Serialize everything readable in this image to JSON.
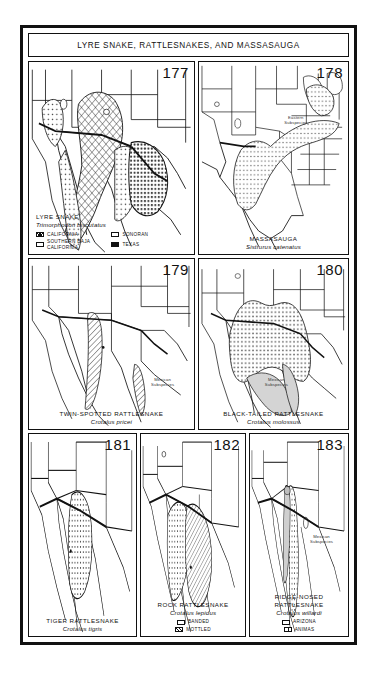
{
  "plate": {
    "title": "LYRE SNAKE, RATTLESNAKES, AND MASSASAUGA"
  },
  "panels": [
    {
      "number": "177",
      "common_name": "LYRE SNAKE",
      "scientific_name": "Trimorphodon biscutatus",
      "caption_align": "left",
      "legend": [
        {
          "label": "CALIFORNIA",
          "pattern": "grid"
        },
        {
          "label": "SONORAN",
          "pattern": "dot"
        },
        {
          "label": "SOUTHERN BAJA CALIFORNIA",
          "pattern": "dot2"
        },
        {
          "label": "TEXAS",
          "pattern": "dark"
        }
      ],
      "annotations": []
    },
    {
      "number": "178",
      "common_name": "MASSASAUGA",
      "scientific_name": "Sistrurus catenatus",
      "caption_align": "center",
      "legend": [],
      "annotations": [
        {
          "text": "Eastern\nSubspecies",
          "x": 60,
          "y": 30
        }
      ]
    },
    {
      "number": "179",
      "common_name": "TWIN-SPOTTED RATTLESNAKE",
      "scientific_name": "Crotalus pricei",
      "caption_align": "center",
      "legend": [],
      "annotations": [
        {
          "text": "Mexican\nSubspecies",
          "x": 69,
          "y": 73
        }
      ]
    },
    {
      "number": "180",
      "common_name": "BLACK-TAILED RATTLESNAKE",
      "scientific_name": "Crotalus molossus",
      "caption_align": "center",
      "legend": [],
      "annotations": [
        {
          "text": "Mexican\nSubspecies",
          "x": 40,
          "y": 74
        }
      ]
    },
    {
      "number": "181",
      "common_name": "TIGER RATTLESNAKE",
      "scientific_name": "Crotalus tigris",
      "caption_align": "center",
      "legend": [],
      "annotations": []
    },
    {
      "number": "182",
      "common_name": "ROCK RATTLESNAKE",
      "scientific_name": "Crotalus lepidus",
      "caption_align": "center",
      "legend": [
        {
          "label": "BANDED",
          "pattern": "dot"
        },
        {
          "label": "MOTTLED",
          "pattern": "hatch"
        }
      ],
      "annotations": []
    },
    {
      "number": "183",
      "common_name": "RIDGE-NOSED RATTLESNAKE",
      "scientific_name": "Crotalus willardi",
      "caption_align": "center",
      "legend": [
        {
          "label": "ARIZONA",
          "pattern": "dot"
        },
        {
          "label": "ANIMAS",
          "pattern": "cross"
        }
      ],
      "annotations": [
        {
          "text": "Mexican\nSubspecies",
          "x": 63,
          "y": 55
        }
      ]
    }
  ],
  "colors": {
    "ink": "#111111",
    "paper": "#ffffff",
    "range_fill": "#c8c8c8"
  }
}
